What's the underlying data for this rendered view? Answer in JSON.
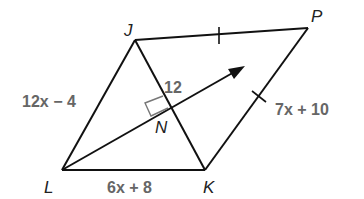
{
  "figure": {
    "top_text_fragment": "",
    "points": {
      "J": {
        "label": "J",
        "x": 135,
        "y": 40
      },
      "P": {
        "label": "P",
        "x": 308,
        "y": 28
      },
      "K": {
        "label": "K",
        "x": 205,
        "y": 170
      },
      "L": {
        "label": "L",
        "x": 62,
        "y": 170
      },
      "N": {
        "label": "N",
        "x": 170,
        "y": 110
      }
    },
    "labels": {
      "JL": "12x − 4",
      "JN": "12",
      "PK": "7x + 10",
      "LK": "6x + 8"
    },
    "colors": {
      "line": "#111111",
      "expression": "#666666",
      "right_angle": "#777777"
    }
  }
}
